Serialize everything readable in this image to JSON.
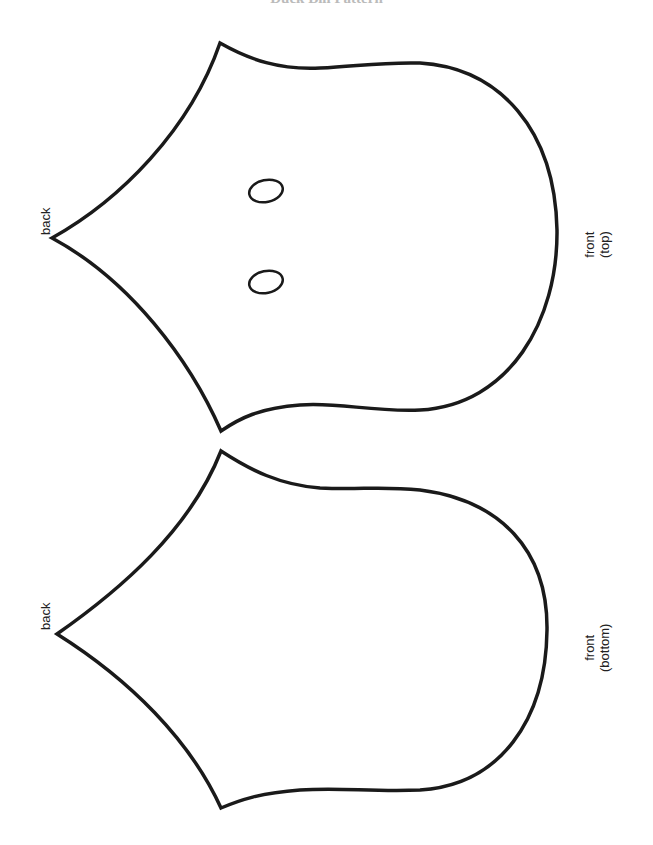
{
  "title": "Duck Bill Pattern",
  "pieces": [
    {
      "name": "top",
      "back_label": "back",
      "front_label": [
        "front",
        "(top)"
      ],
      "has_nostrils": true
    },
    {
      "name": "bottom",
      "back_label": "back",
      "front_label": [
        "front",
        "(bottom)"
      ],
      "has_nostrils": false
    }
  ],
  "colors": {
    "line": "#1a1a1a",
    "background": "#ffffff"
  }
}
